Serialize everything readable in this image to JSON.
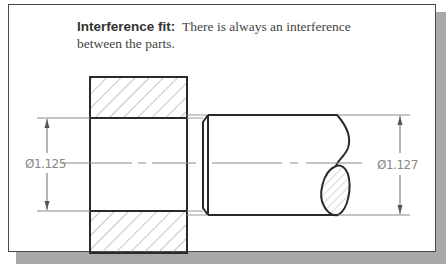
{
  "figure": {
    "caption": {
      "term": "Interference fit:",
      "description_line1": "There is always an interference",
      "description_line2": "between the parts."
    },
    "parts": {
      "hub": {
        "label": "hole / hub section (hatched)",
        "dimension": "Ø1.125"
      },
      "shaft": {
        "label": "shaft with chamfered end and broken-off section",
        "dimension": "Ø1.127"
      }
    },
    "dimensions": {
      "hole_diameter": "Ø1.125",
      "shaft_diameter": "Ø1.127"
    },
    "colors": {
      "line": "#2a2a2a",
      "thin_line": "#7a7a7a",
      "dim_text": "#888888",
      "frame_shadow": "#a8a8a8"
    }
  }
}
